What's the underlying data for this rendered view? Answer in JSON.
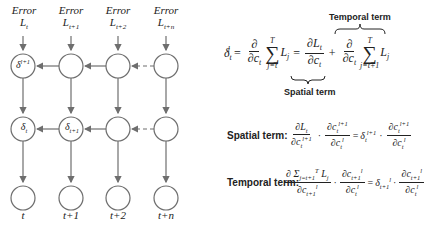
{
  "diagram": {
    "error_labels": [
      {
        "title": "Error",
        "symbol": "L",
        "sub": "t"
      },
      {
        "title": "Error",
        "symbol": "L",
        "sub": "t+1"
      },
      {
        "title": "Error",
        "symbol": "L",
        "sub": "t+2"
      },
      {
        "title": "Error",
        "symbol": "L",
        "sub": "t+n"
      }
    ],
    "row1_nodes": [
      {
        "symbol": "δ",
        "sub": "t",
        "sup": "l+1"
      },
      {
        "symbol": "",
        "sub": "",
        "sup": ""
      },
      {
        "symbol": "",
        "sub": "",
        "sup": ""
      },
      {
        "symbol": "",
        "sub": "",
        "sup": ""
      }
    ],
    "row2_nodes": [
      {
        "symbol": "δ",
        "sub": "t",
        "sup": "l"
      },
      {
        "symbol": "δ",
        "sub": "t+1",
        "sup": "l"
      },
      {
        "symbol": "",
        "sub": "",
        "sup": ""
      },
      {
        "symbol": "",
        "sub": "",
        "sup": ""
      }
    ],
    "time_labels": [
      "t",
      "t+1",
      "t+2",
      "t+n"
    ]
  },
  "main_equation": {
    "lhs": "δ",
    "lhs_sub": "t",
    "lhs_sup": "l",
    "partial": "∂",
    "c_sym": "c",
    "sum_top": "T",
    "sum_bot_1": "j=t",
    "sum_bot_2": "j=t+1",
    "L_sym": "L",
    "L_sub_j": "j",
    "L_sub_t": "t",
    "temporal_term_label": "Temporal term",
    "spatial_term_label": "Spatial term"
  },
  "spatial_row": {
    "label": "Spatial term:",
    "sup_l1": "l+1",
    "sup_l": "l"
  },
  "temporal_row": {
    "label": "Temporal term:",
    "sum_expr": "∂ Σ",
    "sum_sub": "j=t+1",
    "sum_sup": "T",
    "sub_t1": "t+1"
  },
  "colors": {
    "stroke": "#6e6e6e",
    "text": "#222222",
    "background": "#ffffff"
  }
}
